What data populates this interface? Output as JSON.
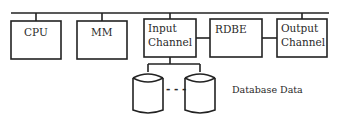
{
  "diagram": {
    "nodes": {
      "cpu": {
        "label": "CPU"
      },
      "mm": {
        "label": "MM"
      },
      "input_channel": {
        "line1": "Input",
        "line2": "Channel"
      },
      "rdbe": {
        "label": "RDBE"
      },
      "output_channel": {
        "line1": "Output",
        "line2": "Channel"
      },
      "database": {
        "label": "Database Data",
        "ellipsis": "- - -"
      }
    },
    "edges": [
      {
        "from": "bus",
        "to": "cpu"
      },
      {
        "from": "bus",
        "to": "mm"
      },
      {
        "from": "bus",
        "to": "input_channel"
      },
      {
        "from": "bus",
        "to": "output_channel"
      },
      {
        "from": "input_channel",
        "to": "rdbe"
      },
      {
        "from": "rdbe",
        "to": "output_channel"
      },
      {
        "from": "input_channel",
        "to": "database"
      }
    ]
  }
}
